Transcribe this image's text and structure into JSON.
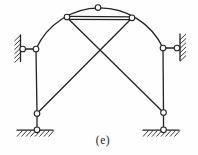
{
  "figure": {
    "label": "(e)",
    "ink_color": "#222222",
    "background_color": "#fefefe",
    "canvas": {
      "width": 198,
      "height": 155
    },
    "pin_radius": 2.8,
    "line_width": 1.3,
    "hatch_width": 0.9,
    "pins": [
      {
        "x": 22.7,
        "y": 49,
        "name": "left-wall-pin"
      },
      {
        "x": 36,
        "y": 49,
        "name": "left-shoulder-pin"
      },
      {
        "x": 67,
        "y": 17,
        "name": "arch-left-pin"
      },
      {
        "x": 98,
        "y": 7.6,
        "name": "arch-apex-pin"
      },
      {
        "x": 132,
        "y": 17.8,
        "name": "arch-right-pin"
      },
      {
        "x": 163,
        "y": 48,
        "name": "right-shoulder-pin"
      },
      {
        "x": 177,
        "y": 48,
        "name": "right-wall-pin"
      },
      {
        "x": 37,
        "y": 113.5,
        "name": "left-knee-pin"
      },
      {
        "x": 163.5,
        "y": 112.5,
        "name": "right-knee-pin"
      },
      {
        "x": 37,
        "y": 129.8,
        "name": "left-ground-pin"
      },
      {
        "x": 163.5,
        "y": 129.8,
        "name": "right-ground-pin"
      }
    ],
    "arcs": [
      {
        "d": "M 36 49 A 70 70 0 0 1 163 48",
        "name": "arch-member"
      }
    ],
    "members": [
      {
        "x1": 24,
        "y1": 49,
        "x2": 36,
        "y2": 49,
        "name": "left-wall-link"
      },
      {
        "x1": 36,
        "y1": 49,
        "x2": 37,
        "y2": 113.5,
        "name": "left-column"
      },
      {
        "x1": 67,
        "y1": 16.3,
        "x2": 132,
        "y2": 16.9,
        "name": "top-bar-upper-edge"
      },
      {
        "x1": 68,
        "y1": 19.4,
        "x2": 131,
        "y2": 19.7,
        "name": "top-bar-lower-edge"
      },
      {
        "x1": 67,
        "y1": 17.5,
        "x2": 163.5,
        "y2": 112.5,
        "name": "diagonal-left-to-right"
      },
      {
        "x1": 132,
        "y1": 18,
        "x2": 37,
        "y2": 113.5,
        "name": "diagonal-right-to-left"
      },
      {
        "x1": 163,
        "y1": 48,
        "x2": 163.5,
        "y2": 112.5,
        "name": "right-column"
      },
      {
        "x1": 163,
        "y1": 48,
        "x2": 176,
        "y2": 48,
        "name": "right-wall-link"
      },
      {
        "x1": 37,
        "y1": 113.5,
        "x2": 37,
        "y2": 129.8,
        "name": "left-base-link"
      },
      {
        "x1": 163.5,
        "y1": 112.5,
        "x2": 163.5,
        "y2": 129.8,
        "name": "right-base-link"
      },
      {
        "x1": 20.5,
        "y1": 35,
        "x2": 20.5,
        "y2": 61.5,
        "name": "left-wall-face"
      },
      {
        "x1": 180,
        "y1": 34,
        "x2": 180,
        "y2": 60.5,
        "name": "right-wall-face"
      },
      {
        "x1": 17,
        "y1": 130.2,
        "x2": 53,
        "y2": 130.2,
        "name": "left-ground-line"
      },
      {
        "x1": 143,
        "y1": 130.2,
        "x2": 179,
        "y2": 130.2,
        "name": "right-ground-line"
      }
    ],
    "hatch_strokes": [
      {
        "x1": 14.5,
        "y1": 41.0,
        "x2": 20.5,
        "y2": 35.3
      },
      {
        "x1": 14.5,
        "y1": 45.3,
        "x2": 20.5,
        "y2": 39.6
      },
      {
        "x1": 14.5,
        "y1": 49.6,
        "x2": 20.5,
        "y2": 43.9
      },
      {
        "x1": 14.5,
        "y1": 53.9,
        "x2": 20.5,
        "y2": 48.2
      },
      {
        "x1": 14.5,
        "y1": 58.2,
        "x2": 20.5,
        "y2": 52.5
      },
      {
        "x1": 14.5,
        "y1": 62.5,
        "x2": 20.5,
        "y2": 56.8
      },
      {
        "x1": 180,
        "y1": 39.8,
        "x2": 186,
        "y2": 34.1
      },
      {
        "x1": 180,
        "y1": 44.1,
        "x2": 186,
        "y2": 38.4
      },
      {
        "x1": 180,
        "y1": 48.4,
        "x2": 186,
        "y2": 42.7
      },
      {
        "x1": 180,
        "y1": 52.7,
        "x2": 186,
        "y2": 47.0
      },
      {
        "x1": 180,
        "y1": 57.0,
        "x2": 186,
        "y2": 51.3
      },
      {
        "x1": 180,
        "y1": 61.3,
        "x2": 186,
        "y2": 55.6
      },
      {
        "x1": 17.0,
        "y1": 136.5,
        "x2": 22.5,
        "y2": 130.5
      },
      {
        "x1": 21.5,
        "y1": 136.5,
        "x2": 27.0,
        "y2": 130.5
      },
      {
        "x1": 26.0,
        "y1": 136.5,
        "x2": 31.5,
        "y2": 130.5
      },
      {
        "x1": 30.5,
        "y1": 136.5,
        "x2": 36.0,
        "y2": 130.5
      },
      {
        "x1": 35.0,
        "y1": 136.5,
        "x2": 40.5,
        "y2": 130.5
      },
      {
        "x1": 39.5,
        "y1": 136.5,
        "x2": 45.0,
        "y2": 130.5
      },
      {
        "x1": 44.0,
        "y1": 136.5,
        "x2": 49.5,
        "y2": 130.5
      },
      {
        "x1": 48.5,
        "y1": 136.5,
        "x2": 54.0,
        "y2": 130.5
      },
      {
        "x1": 143.0,
        "y1": 136.5,
        "x2": 148.5,
        "y2": 130.5
      },
      {
        "x1": 147.5,
        "y1": 136.5,
        "x2": 153.0,
        "y2": 130.5
      },
      {
        "x1": 152.0,
        "y1": 136.5,
        "x2": 157.5,
        "y2": 130.5
      },
      {
        "x1": 156.5,
        "y1": 136.5,
        "x2": 162.0,
        "y2": 130.5
      },
      {
        "x1": 161.0,
        "y1": 136.5,
        "x2": 166.5,
        "y2": 130.5
      },
      {
        "x1": 165.5,
        "y1": 136.5,
        "x2": 171.0,
        "y2": 130.5
      },
      {
        "x1": 170.0,
        "y1": 136.5,
        "x2": 175.5,
        "y2": 130.5
      },
      {
        "x1": 174.5,
        "y1": 136.5,
        "x2": 180.0,
        "y2": 130.5
      }
    ]
  }
}
